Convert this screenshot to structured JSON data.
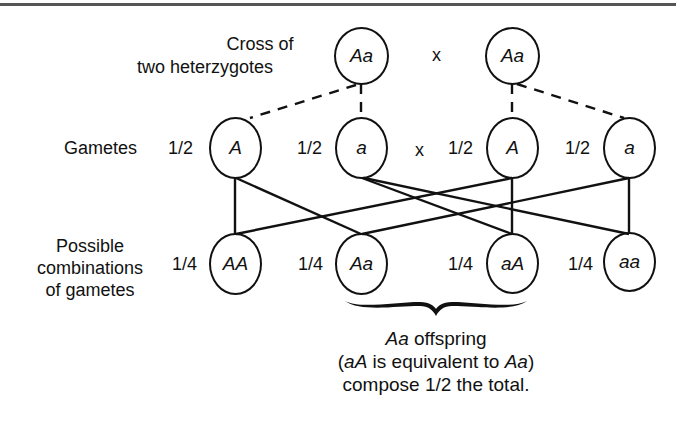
{
  "figure": {
    "rows": {
      "parents_label": [
        "Cross of",
        "two heterzygotes"
      ],
      "gametes_label": "Gametes",
      "combinations_label": [
        "Possible",
        "combinations",
        "of gametes"
      ]
    },
    "parents": [
      {
        "genotype": "Aa"
      },
      {
        "genotype": "Aa"
      }
    ],
    "cross_symbol": "x",
    "gametes": [
      {
        "allele": "A",
        "prob": "1/2"
      },
      {
        "allele": "a",
        "prob": "1/2"
      },
      {
        "allele": "A",
        "prob": "1/2"
      },
      {
        "allele": "a",
        "prob": "1/2"
      }
    ],
    "offspring": [
      {
        "genotype": "AA",
        "prob": "1/4"
      },
      {
        "genotype": "Aa",
        "prob": "1/4"
      },
      {
        "genotype": "aA",
        "prob": "1/4"
      },
      {
        "genotype": "aa",
        "prob": "1/4"
      }
    ],
    "note": {
      "line1_italic": "Aa",
      "line1_rest": " offspring",
      "line2_open": "(",
      "line2_italic1": "aA",
      "line2_mid": " is equivalent to ",
      "line2_italic2": "Aa",
      "line2_close": ")",
      "line3": "compose 1/2 the total."
    },
    "colors": {
      "ink": "#111111",
      "background": "#ffffff",
      "rule": "#555555"
    }
  }
}
